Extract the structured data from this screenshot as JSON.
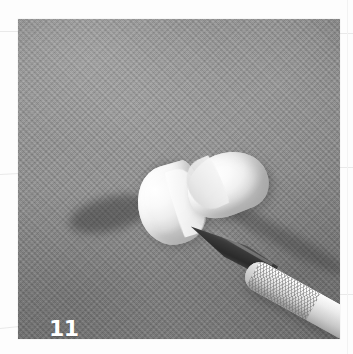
{
  "page": {
    "type": "instructional-step-photograph",
    "background_color": "#fdfdfd"
  },
  "photo": {
    "caption_number": "11",
    "caption_color": "#ffffff",
    "background_color": "#8b8b8b",
    "background_description": "gray woven fabric cloth",
    "subjects": [
      {
        "name": "clay-half-left",
        "description": "white clay half-dome, cut face angled up-right",
        "color": "#f7f7f7"
      },
      {
        "name": "clay-half-right",
        "description": "white clay half-dome, cut face angled down-left",
        "color": "#fafafa"
      },
      {
        "name": "craft-knife",
        "description": "craft knife with dark steel blade and knurled metal handle",
        "blade_color": "#3a3a3a",
        "handle_color": "#e0e0e0"
      }
    ]
  },
  "margin_rules": {
    "description": "faint printed guide lines bleeding in from page layout",
    "color": "#e9e9e9"
  }
}
